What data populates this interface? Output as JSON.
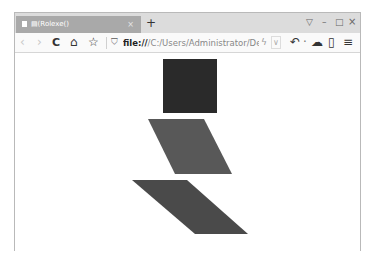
{
  "browser": {
    "tab": {
      "title": "▤(Rolexe()",
      "close_glyph": "×"
    },
    "new_tab_glyph": "+",
    "window_controls": {
      "restore_down_glyph": "▽",
      "minimize_glyph": "–",
      "maximize_glyph": "□",
      "close_glyph": "×"
    },
    "toolbar": {
      "back_glyph": "‹",
      "forward_glyph": "›",
      "reload_glyph": "C",
      "home_glyph": "⌂",
      "favorite_glyph": "☆",
      "shield_glyph": "⛉",
      "url_scheme": "file://",
      "url_path": "/C:/Users/Administrator/Desl",
      "lightning_glyph": "ϟ",
      "dropdown_glyph": "∨",
      "undo_glyph": "↶",
      "dot_glyph": "·",
      "cloud_glyph": "☁",
      "mobile_glyph": "▯",
      "menu_glyph": "≡"
    }
  },
  "page": {
    "shapes": [
      {
        "type": "square",
        "color": "#2a2a2a",
        "points": "148,6 202,6 202,60 148,60"
      },
      {
        "type": "parallelogram",
        "color": "#585858",
        "points": "133,66 189,66 217,121 160,121"
      },
      {
        "type": "parallelogram",
        "color": "#4a4a4a",
        "points": "117,127 172,127 233,181 180,181"
      }
    ]
  }
}
